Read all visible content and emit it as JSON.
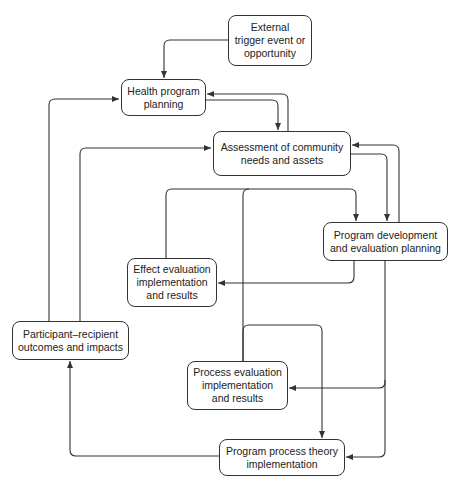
{
  "diagram": {
    "type": "flowchart",
    "nodes": {
      "external": {
        "lines": [
          "External",
          "trigger event or",
          "opportunity"
        ]
      },
      "health_planning": {
        "lines": [
          "Health program",
          "planning"
        ]
      },
      "assessment": {
        "lines": [
          "Assessment of community",
          "needs and assets"
        ]
      },
      "program_development": {
        "lines": [
          "Program development",
          "and evaluation planning"
        ]
      },
      "effect_evaluation": {
        "lines": [
          "Effect evaluation",
          "implementation",
          "and results"
        ]
      },
      "participant_outcomes": {
        "lines": [
          "Participant–recipient",
          "outcomes and impacts"
        ]
      },
      "process_evaluation": {
        "lines": [
          "Process evaluation",
          "implementation",
          "and results"
        ]
      },
      "process_theory": {
        "lines": [
          "Program process theory",
          "implementation"
        ]
      }
    },
    "edges": [
      {
        "from": "External trigger event or opportunity",
        "to": "Health program planning"
      },
      {
        "from": "Health program planning",
        "to": "Assessment of community needs and assets"
      },
      {
        "from": "Assessment of community needs and assets",
        "to": "Health program planning"
      },
      {
        "from": "Assessment of community needs and assets",
        "to": "Program development and evaluation planning"
      },
      {
        "from": "Program development and evaluation planning",
        "to": "Assessment of community needs and assets"
      },
      {
        "from": "Effect evaluation implementation and results",
        "to": "Program development and evaluation planning"
      },
      {
        "from": "Process evaluation implementation and results",
        "to": "Program development and evaluation planning"
      },
      {
        "from": "Program development and evaluation planning",
        "to": "Effect evaluation implementation and results"
      },
      {
        "from": "Program development and evaluation planning",
        "to": "Process evaluation implementation and results"
      },
      {
        "from": "Program development and evaluation planning",
        "to": "Program process theory implementation"
      },
      {
        "from": "Process evaluation implementation and results",
        "to": "Program process theory implementation"
      },
      {
        "from": "Program process theory implementation",
        "to": "Participant–recipient outcomes and impacts"
      },
      {
        "from": "Participant–recipient outcomes and impacts",
        "to": "Health program planning"
      },
      {
        "from": "Participant–recipient outcomes and impacts",
        "to": "Assessment of community needs and assets"
      }
    ],
    "colors": {
      "line": "#333333",
      "background": "#ffffff",
      "text": "#222222"
    }
  }
}
